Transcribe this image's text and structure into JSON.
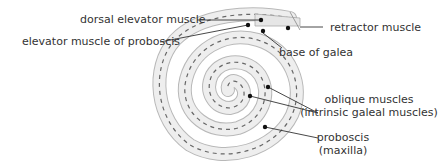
{
  "diagram": {
    "colors": {
      "tube_fill": "#e8e8e8",
      "tube_stroke": "#b0b0b0",
      "muscle_dash": "#555555",
      "leader_line": "#333333",
      "dot": "#111111",
      "text": "#333333"
    },
    "labels": {
      "dorsal_elevator": "dorsal elevator muscle",
      "elevator_proboscis": "elevator muscle of proboscis",
      "retractor": "retractor muscle",
      "base_galea": "base of galea",
      "oblique_line1": "oblique muscles",
      "oblique_line2": "(intrinsic galeal muscles)",
      "proboscis_line1": "proboscis",
      "proboscis_line2": "(maxilla)"
    }
  }
}
